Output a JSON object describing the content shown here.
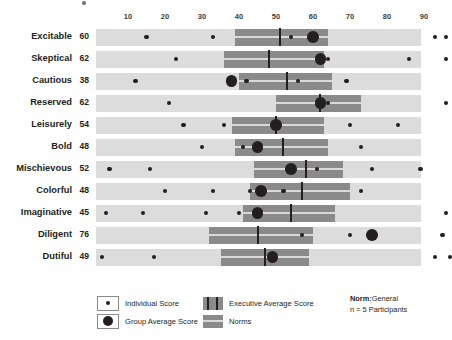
{
  "chart_data": {
    "type": "bar",
    "title": "",
    "xlabel": "",
    "ylabel": "",
    "xlim": [
      0,
      100
    ],
    "grid": false,
    "legend_position": "bottom",
    "axis_ticks": [
      10,
      20,
      30,
      40,
      50,
      60,
      70,
      80,
      90
    ],
    "categories": [
      "Excitable",
      "Skeptical",
      "Cautious",
      "Reserved",
      "Leisurely",
      "Bold",
      "Mischievous",
      "Colorful",
      "Imaginative",
      "Diligent",
      "Dutiful"
    ],
    "values": [
      60,
      62,
      38,
      62,
      54,
      48,
      52,
      48,
      45,
      76,
      49
    ],
    "rows": [
      {
        "label": "Excitable",
        "score": 60,
        "norm_band": [
          39,
          64
        ],
        "executive_average": 51,
        "group_average": 60,
        "individual_scores": [
          15,
          33,
          54,
          93,
          96
        ]
      },
      {
        "label": "Skeptical",
        "score": 62,
        "norm_band": [
          36,
          63
        ],
        "executive_average": 48,
        "group_average": 62,
        "individual_scores": [
          23,
          64,
          86,
          96
        ]
      },
      {
        "label": "Cautious",
        "score": 38,
        "norm_band": [
          40,
          65
        ],
        "executive_average": 53,
        "group_average": 38,
        "individual_scores": [
          12,
          42,
          56,
          69
        ]
      },
      {
        "label": "Reserved",
        "score": 62,
        "norm_band": [
          50,
          73
        ],
        "executive_average": 62,
        "group_average": 62,
        "individual_scores": [
          21,
          64,
          96
        ]
      },
      {
        "label": "Leisurely",
        "score": 54,
        "norm_band": [
          38,
          63
        ],
        "executive_average": 50,
        "group_average": 50,
        "individual_scores": [
          25,
          36,
          70,
          83
        ]
      },
      {
        "label": "Bold",
        "score": 48,
        "norm_band": [
          39,
          64
        ],
        "executive_average": 52,
        "group_average": 45,
        "individual_scores": [
          30,
          41,
          73
        ]
      },
      {
        "label": "Mischievous",
        "score": 52,
        "norm_band": [
          44,
          68
        ],
        "executive_average": 58,
        "group_average": 54,
        "individual_scores": [
          5,
          16,
          61,
          76,
          89
        ]
      },
      {
        "label": "Colorful",
        "score": 48,
        "norm_band": [
          43,
          70
        ],
        "executive_average": 57,
        "group_average": 46,
        "individual_scores": [
          20,
          33,
          43,
          52,
          73
        ]
      },
      {
        "label": "Imaginative",
        "score": 45,
        "norm_band": [
          41,
          66
        ],
        "executive_average": 54,
        "group_average": 45,
        "individual_scores": [
          4,
          14,
          31,
          40,
          96
        ]
      },
      {
        "label": "Diligent",
        "score": 76,
        "norm_band": [
          32,
          60
        ],
        "executive_average": 45,
        "group_average": 76,
        "individual_scores": [
          57,
          70,
          95
        ]
      },
      {
        "label": "Dutiful",
        "score": 49,
        "norm_band": [
          35,
          59
        ],
        "executive_average": 47,
        "group_average": 49,
        "individual_scores": [
          3,
          17,
          93,
          97
        ]
      }
    ],
    "colors": {
      "track": "#dcdcdc",
      "norm_band": "#8a8a8a",
      "marker": "#231f20",
      "band_centerline": "#d9d9d9",
      "text": "#231f20"
    }
  },
  "legend": {
    "individual_score": "Individual Score",
    "group_average_score": "Group Average Score",
    "executive_average_score": "Executive Average Score",
    "norms": "Norms",
    "norm_label": "Norm:",
    "norm_value": "General",
    "participants": "n = 5 Participants"
  }
}
